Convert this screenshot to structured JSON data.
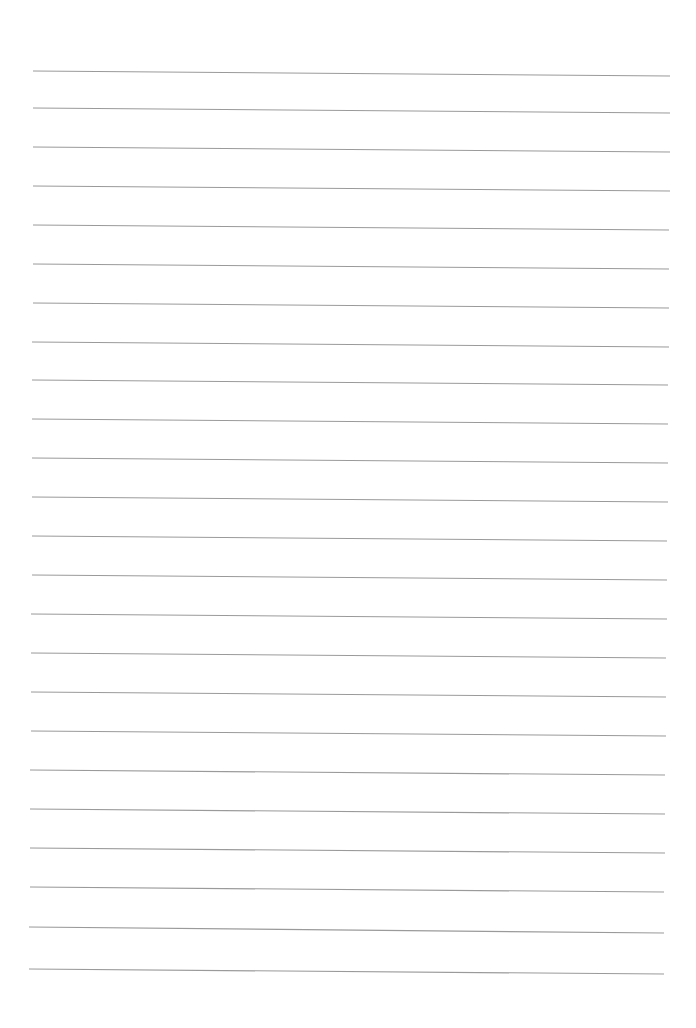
{
  "page": {
    "type": "lined-paper",
    "background_color": "#ffffff",
    "line_color": "#9a9a9a",
    "line_count": 24,
    "lines": [
      {
        "x1": 33,
        "y1": 71,
        "x2": 670,
        "y2": 76
      },
      {
        "x1": 33,
        "y1": 108,
        "x2": 670,
        "y2": 113
      },
      {
        "x1": 33,
        "y1": 147,
        "x2": 670,
        "y2": 152
      },
      {
        "x1": 33,
        "y1": 186,
        "x2": 670,
        "y2": 191
      },
      {
        "x1": 33,
        "y1": 225,
        "x2": 669,
        "y2": 230
      },
      {
        "x1": 33,
        "y1": 264,
        "x2": 669,
        "y2": 269
      },
      {
        "x1": 33,
        "y1": 303,
        "x2": 669,
        "y2": 308
      },
      {
        "x1": 32,
        "y1": 342,
        "x2": 669,
        "y2": 347
      },
      {
        "x1": 32,
        "y1": 380,
        "x2": 668,
        "y2": 385
      },
      {
        "x1": 32,
        "y1": 419,
        "x2": 668,
        "y2": 424
      },
      {
        "x1": 32,
        "y1": 458,
        "x2": 668,
        "y2": 463
      },
      {
        "x1": 32,
        "y1": 497,
        "x2": 668,
        "y2": 502
      },
      {
        "x1": 32,
        "y1": 536,
        "x2": 667,
        "y2": 541
      },
      {
        "x1": 32,
        "y1": 575,
        "x2": 667,
        "y2": 580
      },
      {
        "x1": 31,
        "y1": 614,
        "x2": 667,
        "y2": 619
      },
      {
        "x1": 31,
        "y1": 653,
        "x2": 666,
        "y2": 658
      },
      {
        "x1": 31,
        "y1": 692,
        "x2": 666,
        "y2": 697
      },
      {
        "x1": 31,
        "y1": 731,
        "x2": 666,
        "y2": 736
      },
      {
        "x1": 30,
        "y1": 770,
        "x2": 665,
        "y2": 775
      },
      {
        "x1": 30,
        "y1": 809,
        "x2": 665,
        "y2": 814
      },
      {
        "x1": 30,
        "y1": 848,
        "x2": 665,
        "y2": 853
      },
      {
        "x1": 30,
        "y1": 887,
        "x2": 664,
        "y2": 892
      },
      {
        "x1": 29,
        "y1": 927,
        "x2": 664,
        "y2": 933
      },
      {
        "x1": 29,
        "y1": 969,
        "x2": 664,
        "y2": 974
      }
    ]
  }
}
